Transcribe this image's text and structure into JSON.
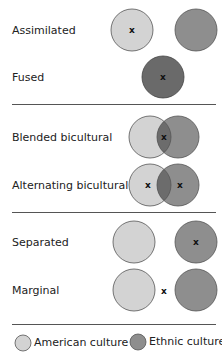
{
  "colors": {
    "american": "#d3d3d3",
    "ethnic": "#8e8e8e",
    "overlap": "#6c6c6c",
    "fused": "#6a6a6a",
    "stroke": "#555555"
  },
  "rows": [
    {
      "label": "Assimilated",
      "marker": "x"
    },
    {
      "label": "Fused",
      "marker": "x"
    },
    {
      "label": "Blended bicultural",
      "marker": "x"
    },
    {
      "label": "Alternating bicultural",
      "marker": "x"
    },
    {
      "label": "Separated",
      "marker": "x"
    },
    {
      "label": "Marginal",
      "marker": "x"
    }
  ],
  "legend": {
    "american": "American culture",
    "ethnic": "Ethnic culture"
  }
}
